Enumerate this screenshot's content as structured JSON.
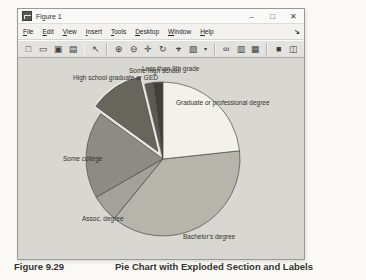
{
  "window": {
    "title": "Figure 1",
    "controls": [
      {
        "name": "minimize-button",
        "glyph": "–"
      },
      {
        "name": "maximize-button",
        "glyph": "□"
      },
      {
        "name": "close-button",
        "glyph": "✕"
      }
    ]
  },
  "menu_bar": {
    "items": [
      {
        "label": "File"
      },
      {
        "label": "Edit"
      },
      {
        "label": "View"
      },
      {
        "label": "Insert"
      },
      {
        "label": "Tools"
      },
      {
        "label": "Desktop"
      },
      {
        "label": "Window"
      },
      {
        "label": "Help"
      }
    ],
    "dock_glyph": "↘"
  },
  "toolbar": {
    "items": [
      {
        "name": "new-figure",
        "glyph": "□"
      },
      {
        "name": "open-file",
        "glyph": "▭"
      },
      {
        "name": "save-figure",
        "glyph": "▣"
      },
      {
        "name": "print-figure",
        "glyph": "▤"
      },
      {
        "sep": true
      },
      {
        "name": "edit-plot",
        "glyph": "↖"
      },
      {
        "sep": true
      },
      {
        "name": "zoom-in",
        "glyph": "⊕"
      },
      {
        "name": "zoom-out",
        "glyph": "⊖"
      },
      {
        "name": "pan",
        "glyph": "✛"
      },
      {
        "name": "rotate-3d",
        "glyph": "↻"
      },
      {
        "name": "data-cursor",
        "glyph": "⌖"
      },
      {
        "name": "brush-data",
        "glyph": "▨"
      },
      {
        "name": "brush-dropdown",
        "glyph": "▾",
        "dd": true
      },
      {
        "sep": true
      },
      {
        "name": "link-plot",
        "glyph": "∞"
      },
      {
        "name": "insert-colorbar",
        "glyph": "▥"
      },
      {
        "name": "insert-legend",
        "glyph": "▦"
      },
      {
        "sep": true
      },
      {
        "name": "hide-plot-tools",
        "glyph": "■"
      },
      {
        "name": "show-plot-tools-dock",
        "glyph": "◫"
      }
    ]
  },
  "chart_data": {
    "type": "pie",
    "title": "",
    "labels": [
      "Less than 9th grade",
      "Some high school",
      "High school graduate or GED",
      "Some college",
      "Assoc. degree",
      "Bachelor's degree",
      "Graduate or professional degree"
    ],
    "values": [
      2.0,
      1.8,
      11.2,
      18.3,
      5.8,
      37.6,
      23.3
    ],
    "unit": "percent-of-whole",
    "explode": [
      0,
      0,
      1,
      0,
      0,
      0,
      0
    ],
    "start_angle_deg": 90,
    "direction": "counterclockwise",
    "legend": "none",
    "colors": [
      "#413f3a",
      "#5c5a53",
      "#67655c",
      "#8d8b83",
      "#a3a199",
      "#b6b4ab",
      "#f2f1ea"
    ],
    "stroke": "#4a4943",
    "gap_color": "#edece7",
    "center": {
      "x": 145,
      "y": 101
    },
    "radius": 77,
    "explode_distance": 9
  },
  "pie_labels": [
    {
      "name": "label-some-high-school",
      "text": "Some high school",
      "x": 111,
      "y": 9
    },
    {
      "name": "label-less-than-9th-grade",
      "text": "Less than 9th grade",
      "x": 124,
      "y": 7
    },
    {
      "name": "label-high-school-grad",
      "text": "High school graduate or GED",
      "x": 55,
      "y": 16
    },
    {
      "name": "label-graduate-professional",
      "text": "Graduate or professional degree",
      "x": 158,
      "y": 41
    },
    {
      "name": "label-some-college",
      "text": "Some college",
      "x": 45,
      "y": 97
    },
    {
      "name": "label-assoc-degree",
      "text": "Assoc. degree",
      "x": 64,
      "y": 157
    },
    {
      "name": "label-bachelors-degree",
      "text": "Bachelor's degree",
      "x": 165,
      "y": 175
    }
  ],
  "caption": {
    "figure_number": "Figure 9.29",
    "title": "Pie Chart with Exploded Section and Labels"
  }
}
